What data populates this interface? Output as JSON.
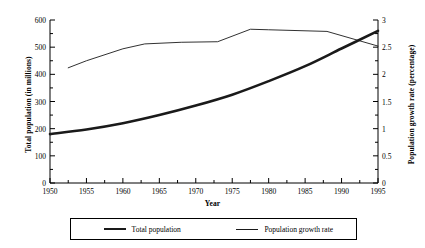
{
  "chart_data": {
    "type": "line",
    "title": "",
    "xlabel": "Year",
    "ylabel": "Total population (in millions)",
    "y2label": "Population growth rate (percentage)",
    "xlim": [
      1950,
      1995
    ],
    "ylim": [
      0,
      600
    ],
    "y2lim": [
      0,
      3
    ],
    "xticks": [
      1950,
      1955,
      1960,
      1965,
      1970,
      1975,
      1980,
      1985,
      1990,
      1995
    ],
    "xticklabels": [
      "1950",
      "1955",
      "1960",
      "1965",
      "1970",
      "1975",
      "1980",
      "1985",
      "1990",
      "1995"
    ],
    "yticks": [
      0,
      100,
      200,
      300,
      400,
      500,
      600
    ],
    "yticklabels": [
      "0",
      "100",
      "200",
      "300",
      "400",
      "500",
      "600"
    ],
    "y2ticks": [
      0,
      0.5,
      1,
      1.5,
      2,
      2.5,
      3
    ],
    "y2ticklabels": [
      "0",
      "0.5",
      "1",
      "1.5",
      "2",
      "2.5",
      "3"
    ],
    "grid": false,
    "legend_position": "bottom",
    "series": [
      {
        "name": "Total population",
        "axis": "left",
        "units": "millions",
        "style": "thick",
        "x": [
          1950,
          1955,
          1960,
          1965,
          1970,
          1975,
          1980,
          1985,
          1990,
          1995
        ],
        "values": [
          180,
          197,
          220,
          250,
          285,
          325,
          375,
          430,
          495,
          560
        ]
      },
      {
        "name": "Population growth rate",
        "axis": "right",
        "units": "percentage",
        "style": "thin",
        "x": [
          1952.5,
          1955,
          1960,
          1963,
          1968,
          1973,
          1977.5,
          1980,
          1988,
          1995
        ],
        "values": [
          2.12,
          2.25,
          2.47,
          2.56,
          2.59,
          2.6,
          2.83,
          2.82,
          2.79,
          2.52
        ]
      }
    ]
  },
  "legend": {
    "items": [
      {
        "label": "Total population"
      },
      {
        "label": "Population growth rate"
      }
    ]
  },
  "colors": {
    "line": "#1a1a1a",
    "axis": "#000000",
    "background": "#ffffff"
  }
}
